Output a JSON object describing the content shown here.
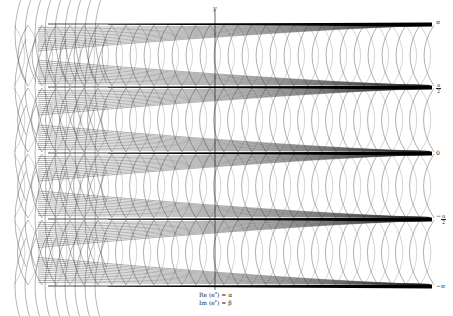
{
  "figure": {
    "y_axis_label": "y",
    "caption_lines": [
      {
        "prefix": "Re (e",
        "sup": "z",
        "suffix": ") = α"
      },
      {
        "prefix": "Im (e",
        "sup": "z",
        "suffix": ") = β"
      }
    ],
    "right_ticks": [
      {
        "label": "π",
        "y": 22,
        "frac": false
      },
      {
        "num": "π",
        "den": "2",
        "y": 87,
        "frac": true,
        "sign": ""
      },
      {
        "label": "0",
        "y": 153,
        "frac": false
      },
      {
        "num": "π",
        "den": "2",
        "y": 218,
        "frac": true,
        "sign": "−"
      },
      {
        "label": "−π",
        "y": 286,
        "frac": false
      }
    ],
    "colors": {
      "line": "#3a3a3a",
      "band": "#000000",
      "background": "#ffffff"
    },
    "layout": {
      "x_left": 8,
      "x_right": 432,
      "band_ys": [
        24,
        87,
        153,
        219,
        286
      ],
      "y_axis_x": 215
    }
  }
}
